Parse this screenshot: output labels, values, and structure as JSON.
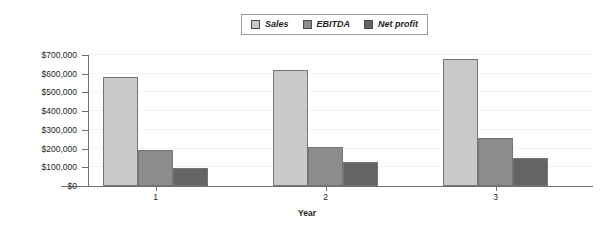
{
  "chart_data": {
    "type": "bar",
    "title": "",
    "xlabel": "Year",
    "ylabel": "",
    "categories": [
      "1",
      "2",
      "3"
    ],
    "series": [
      {
        "name": "Sales",
        "color": "#c9c9c9",
        "values": [
          580000,
          620000,
          680000
        ]
      },
      {
        "name": "EBITDA",
        "color": "#8c8c8c",
        "values": [
          195000,
          210000,
          255000
        ]
      },
      {
        "name": "Net profit",
        "color": "#646464",
        "values": [
          95000,
          130000,
          150000
        ]
      }
    ],
    "ylim": [
      0,
      700000
    ],
    "ytick_values": [
      0,
      100000,
      200000,
      300000,
      400000,
      500000,
      600000,
      700000
    ],
    "ytick_labels": [
      "$0",
      "$100,000",
      "$200,000",
      "$300,000",
      "$400,000",
      "$500,000",
      "$600,000",
      "$700,000"
    ],
    "grid": true,
    "legend_position": "top-center"
  },
  "legend": {
    "entries": [
      {
        "label": "Sales"
      },
      {
        "label": "EBITDA"
      },
      {
        "label": "Net profit"
      }
    ]
  },
  "axes": {
    "x_title": "Year"
  }
}
